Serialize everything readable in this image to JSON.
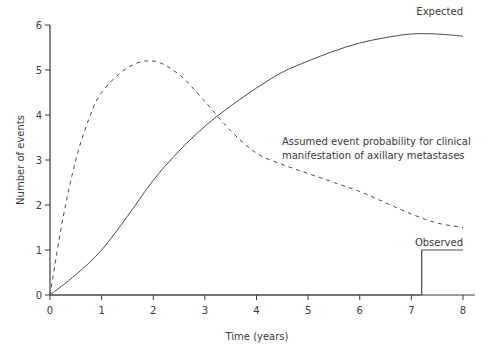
{
  "chart_data": {
    "type": "line",
    "title": "",
    "xlabel": "Time (years)",
    "ylabel": "Number of events",
    "xlim": [
      0,
      8
    ],
    "ylim": [
      0,
      6
    ],
    "xticks": [
      "0",
      "1",
      "2",
      "3",
      "4",
      "5",
      "6",
      "7",
      "8"
    ],
    "yticks": [
      "0",
      "1",
      "2",
      "3",
      "4",
      "5",
      "6"
    ],
    "grid": false,
    "legend": "none (inline labels)",
    "series": [
      {
        "name": "Expected",
        "style": "solid",
        "x": [
          0,
          0.5,
          1,
          1.5,
          2,
          2.5,
          3,
          3.5,
          4,
          4.5,
          5,
          5.5,
          6,
          6.5,
          7,
          7.5,
          8
        ],
        "y": [
          0,
          0.45,
          1.0,
          1.75,
          2.55,
          3.2,
          3.75,
          4.2,
          4.6,
          4.95,
          5.2,
          5.42,
          5.6,
          5.72,
          5.8,
          5.8,
          5.75
        ]
      },
      {
        "name": "Assumed event probability for clinical manifestation of axillary metastases",
        "style": "dashed",
        "x": [
          0,
          0.25,
          0.5,
          0.75,
          1,
          1.5,
          2,
          2.5,
          3,
          3.5,
          4,
          4.5,
          5,
          5.5,
          6,
          6.5,
          7,
          7.5,
          8
        ],
        "y": [
          0,
          1.7,
          3.0,
          3.9,
          4.5,
          5.05,
          5.2,
          4.9,
          4.3,
          3.65,
          3.15,
          2.9,
          2.7,
          2.5,
          2.3,
          2.05,
          1.8,
          1.6,
          1.5
        ]
      },
      {
        "name": "Observed",
        "style": "step",
        "x": [
          0,
          7.2,
          7.2,
          8
        ],
        "y": [
          0,
          0,
          1,
          1
        ]
      }
    ],
    "annotations": [
      {
        "text": "Expected",
        "x": 7.6,
        "y": 5.95
      },
      {
        "text": "Assumed event probability for clinical",
        "x": 4.1,
        "y": 3.5
      },
      {
        "text": "manifestation of axillary metastases",
        "x": 4.1,
        "y": 3.2
      },
      {
        "text": "Observed",
        "x": 7.6,
        "y": 1.15
      }
    ]
  },
  "labels": {
    "xlabel": "Time (years)",
    "ylabel": "Number of events",
    "expected": "Expected",
    "assumed_line1": "Assumed event probability for clinical",
    "assumed_line2": "manifestation of axillary metastases",
    "observed": "Observed"
  },
  "colors": {
    "axis": "#3a3a3a",
    "line": "#4a4a4a"
  }
}
